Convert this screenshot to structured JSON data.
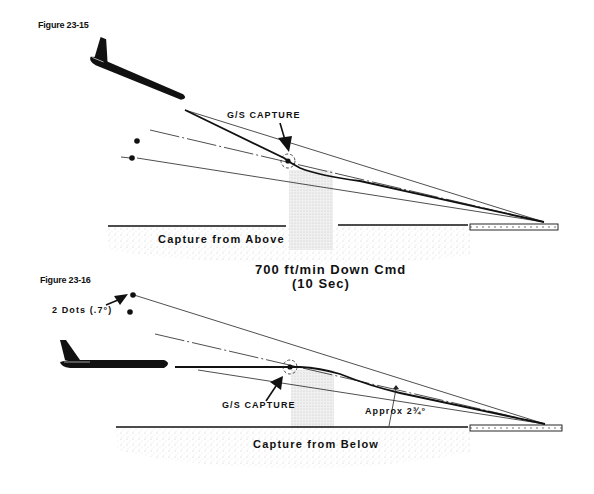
{
  "figures": [
    {
      "label": "Figure 23-15",
      "title": "Capture from Above",
      "capture_label": "G/S CAPTURE"
    },
    {
      "label": "Figure 23-16",
      "title": "Capture from Below",
      "capture_label": "G/S CAPTURE",
      "dots_label": "2 Dots (.7°)",
      "angle_label": "Approx 2¾°"
    }
  ],
  "middle_caption": {
    "line1": "700 ft/min Down Cmd",
    "line2": "(10 Sec)"
  },
  "colors": {
    "ink": "#111111",
    "ground_stipple": "#cfcfcf",
    "capture_zone": "#e4e4e4"
  }
}
